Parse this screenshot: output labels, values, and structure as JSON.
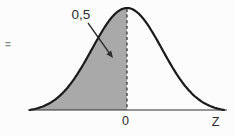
{
  "figure": {
    "type": "normal-distribution-diagram",
    "equals_sign": "=",
    "annotation": {
      "area_label": "0,5",
      "points_to": "shaded-left-half"
    },
    "axis": {
      "origin_tick_label": "0",
      "axis_label": "Z"
    },
    "curve": {
      "kind": "standard-normal-density",
      "mean_tick": "0",
      "shaded_region": "left-of-mean",
      "shaded_area_value": 0.5,
      "dashed_line_at_mean": true
    },
    "colors": {
      "background": "#fcfcfc",
      "shaded_fill": "#a9a9a9",
      "curve_stroke": "#1a1a1a",
      "axis_stroke": "#2e2e2e",
      "dashed_line": "#2e2e2e",
      "arrow": "#2e2e2e",
      "label_text": "#2b2b2b",
      "equals_text": "#8a8a8a"
    }
  }
}
